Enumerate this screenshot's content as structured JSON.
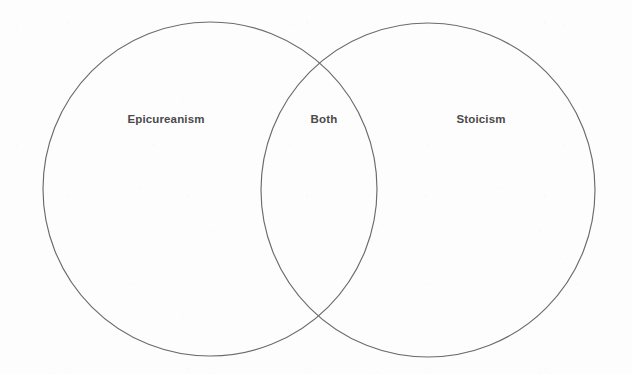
{
  "diagram": {
    "type": "venn",
    "title": "",
    "background_color": "#fdfdfd",
    "stroke_color": "#6b6b6b",
    "label_color": "#4a4a4a",
    "width": 632,
    "height": 374,
    "circles": [
      {
        "id": "left",
        "name": "Epicureanism",
        "cx": 210,
        "cy": 189,
        "r": 167
      },
      {
        "id": "right",
        "name": "Stoicism",
        "cx": 428,
        "cy": 190,
        "r": 167
      }
    ],
    "labels": [
      {
        "id": "left-label",
        "text": "Epicureanism",
        "x": 166,
        "y": 120
      },
      {
        "id": "intersection-label",
        "text": "Both",
        "x": 324,
        "y": 120
      },
      {
        "id": "right-label",
        "text": "Stoicism",
        "x": 481,
        "y": 120
      }
    ],
    "intersection_points": [
      {
        "x": 322,
        "y": 71
      },
      {
        "x": 322,
        "y": 315
      }
    ]
  }
}
